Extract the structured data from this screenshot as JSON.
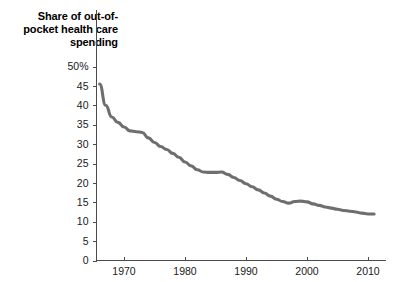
{
  "chart_data": {
    "type": "line",
    "title": "Share of out-of-pocket health care spending",
    "xlabel": "",
    "ylabel": "",
    "ylim": [
      0,
      50
    ],
    "xlim": [
      1966,
      2011
    ],
    "grid": false,
    "legend": null,
    "y_ticks": [
      "0",
      "5",
      "10",
      "15",
      "20",
      "25",
      "30",
      "35",
      "40",
      "45",
      "50%"
    ],
    "y_tick_values": [
      0,
      5,
      10,
      15,
      20,
      25,
      30,
      35,
      40,
      45,
      50
    ],
    "x_ticks": [
      "1970",
      "1980",
      "1990",
      "2000",
      "2010"
    ],
    "x_tick_values": [
      1970,
      1980,
      1990,
      2000,
      2010
    ],
    "series": [
      {
        "name": "Share of out-of-pocket health care spending",
        "color": "#6e6e6e",
        "x": [
          1966,
          1967,
          1968,
          1969,
          1970,
          1971,
          1972,
          1973,
          1974,
          1975,
          1976,
          1977,
          1978,
          1979,
          1980,
          1981,
          1982,
          1983,
          1984,
          1985,
          1986,
          1987,
          1988,
          1989,
          1990,
          1991,
          1992,
          1993,
          1994,
          1995,
          1996,
          1997,
          1998,
          1999,
          2000,
          2001,
          2002,
          2003,
          2004,
          2005,
          2006,
          2007,
          2008,
          2009,
          2010,
          2011
        ],
        "values": [
          45.5,
          40.0,
          37.0,
          35.6,
          34.4,
          33.4,
          33.2,
          33.0,
          31.6,
          30.4,
          29.4,
          28.6,
          27.6,
          26.6,
          25.4,
          24.4,
          23.4,
          22.8,
          22.7,
          22.7,
          22.8,
          22.2,
          21.4,
          20.6,
          19.8,
          19.0,
          18.2,
          17.4,
          16.6,
          15.8,
          15.2,
          14.8,
          15.2,
          15.3,
          15.1,
          14.6,
          14.2,
          13.8,
          13.5,
          13.2,
          12.9,
          12.7,
          12.5,
          12.2,
          12.0,
          12.0
        ]
      }
    ]
  },
  "axes": {
    "y_unit_suffix": "%",
    "y_top_label": "50%"
  }
}
